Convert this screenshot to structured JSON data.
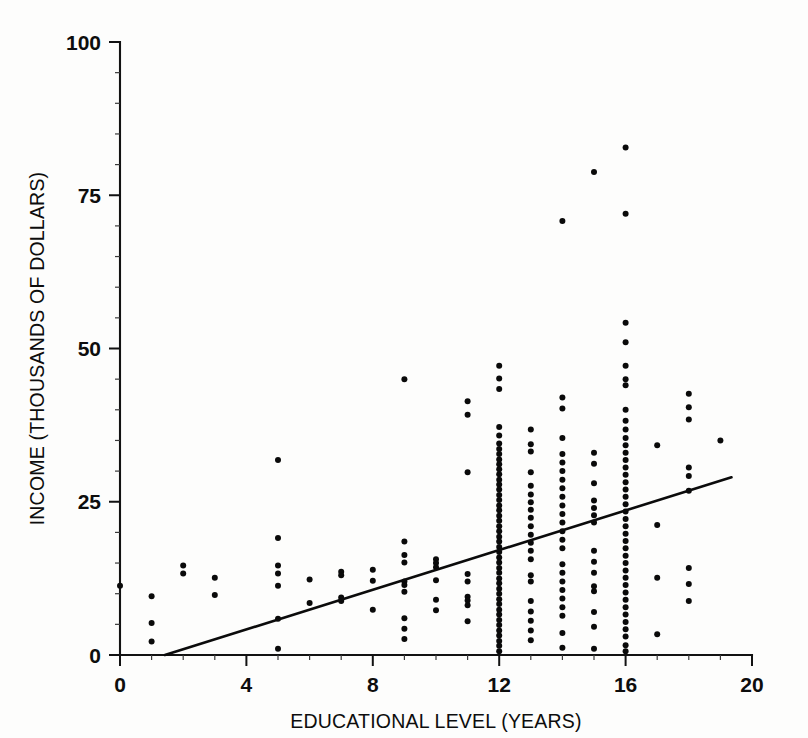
{
  "figure": {
    "background_color": "#fdfdfc",
    "ink_color": "#0a0a0a"
  },
  "axes": {
    "x_title": "EDUCATIONAL LEVEL (YEARS)",
    "y_title": "INCOME (THOUSANDS OF DOLLARS)",
    "x_ticks": [
      "0",
      "4",
      "8",
      "12",
      "16",
      "20"
    ],
    "y_ticks": [
      "0",
      "25",
      "50",
      "75",
      "100"
    ]
  },
  "chart_data": {
    "type": "scatter",
    "title": "",
    "subtitle": "",
    "xlabel": "EDUCATIONAL LEVEL (YEARS)",
    "ylabel": "INCOME (THOUSANDS OF DOLLARS)",
    "xlim": [
      0,
      20
    ],
    "ylim": [
      0,
      100
    ],
    "x_major_ticks": [
      0,
      4,
      8,
      12,
      16,
      20
    ],
    "y_major_ticks": [
      0,
      25,
      50,
      75,
      100
    ],
    "x_minor_tick_step": 1,
    "y_minor_tick_step": 5,
    "grid": false,
    "legend": null,
    "marker": {
      "shape": "circle",
      "size_px": 3.0,
      "color": "#0a0a0a"
    },
    "trendline": {
      "type": "linear-regression",
      "color": "#0b0b0b",
      "x_start": 1.42,
      "y_start": 0,
      "x_end": 19.35,
      "y_end": 29.0,
      "slope": 1.617,
      "intercept": -2.3
    },
    "columns": [
      {
        "x": 0,
        "values": [
          11.3
        ]
      },
      {
        "x": 1,
        "values": [
          9.6,
          5.2,
          2.2
        ]
      },
      {
        "x": 2,
        "values": [
          14.6,
          13.3
        ]
      },
      {
        "x": 3,
        "values": [
          12.6,
          9.8
        ]
      },
      {
        "x": 5,
        "values": [
          31.8,
          19.1,
          14.6,
          13.3,
          11.3,
          5.9,
          1.0
        ]
      },
      {
        "x": 6,
        "values": [
          12.3,
          8.5
        ]
      },
      {
        "x": 7,
        "values": [
          13.6,
          13.0,
          9.4,
          8.8
        ]
      },
      {
        "x": 8,
        "values": [
          13.9,
          12.1,
          7.4
        ]
      },
      {
        "x": 9,
        "values": [
          45.0,
          18.5,
          16.3,
          15.1,
          12.0,
          11.4,
          10.3,
          6.0,
          4.3,
          2.6
        ]
      },
      {
        "x": 10,
        "values": [
          15.6,
          15.0,
          14.3,
          12.2,
          9.0,
          7.3
        ]
      },
      {
        "x": 11,
        "values": [
          41.4,
          39.2,
          29.8,
          13.2,
          12.0,
          9.5,
          8.9,
          8.1,
          5.5
        ]
      },
      {
        "x": 12,
        "values": [
          47.2,
          45.1,
          43.4,
          37.2,
          35.8,
          34.5,
          33.6,
          32.8,
          31.9,
          31.1,
          30.3,
          29.5,
          28.6,
          27.8,
          27.0,
          26.1,
          25.3,
          24.4,
          23.6,
          22.7,
          21.9,
          21.0,
          20.2,
          19.3,
          18.5,
          17.6,
          16.8,
          15.9,
          15.1,
          14.2,
          13.4,
          12.5,
          11.7,
          10.8,
          10.0,
          9.1,
          8.3,
          7.4,
          6.6,
          5.7,
          4.9,
          4.0,
          3.2,
          2.3,
          1.5,
          0.6
        ]
      },
      {
        "x": 13,
        "values": [
          36.8,
          34.4,
          33.2,
          29.8,
          27.6,
          26.2,
          24.9,
          23.7,
          22.4,
          21.0,
          19.6,
          18.3,
          17.0,
          15.6,
          13.0,
          12.0,
          8.8,
          7.1,
          5.6,
          4.0,
          2.4
        ]
      },
      {
        "x": 14,
        "values": [
          70.8,
          42.0,
          40.2,
          35.4,
          32.8,
          31.4,
          30.0,
          28.6,
          27.2,
          25.8,
          24.4,
          23.0,
          21.6,
          20.2,
          18.8,
          17.4,
          14.8,
          13.4,
          12.0,
          10.6,
          9.2,
          7.8,
          6.4,
          3.6,
          1.2
        ]
      },
      {
        "x": 15,
        "values": [
          78.8,
          33.0,
          31.2,
          28.0,
          25.2,
          24.0,
          22.8,
          21.6,
          17.0,
          15.2,
          13.4,
          11.2,
          10.4,
          7.0,
          4.6,
          1.0
        ]
      },
      {
        "x": 16,
        "values": [
          82.8,
          72.0,
          54.2,
          51.0,
          47.2,
          45.0,
          44.0,
          40.0,
          38.2,
          36.8,
          35.4,
          34.2,
          33.0,
          31.8,
          30.6,
          29.4,
          28.2,
          27.0,
          25.8,
          24.6,
          23.4,
          22.2,
          21.0,
          19.8,
          18.6,
          17.4,
          16.2,
          15.0,
          13.8,
          12.6,
          11.4,
          10.2,
          9.0,
          7.8,
          6.6,
          5.4,
          4.2,
          3.0,
          1.6,
          0.6
        ]
      },
      {
        "x": 17,
        "values": [
          34.2,
          21.2,
          12.6,
          3.4
        ]
      },
      {
        "x": 18,
        "values": [
          42.6,
          40.4,
          38.4,
          30.6,
          29.2,
          26.8,
          14.2,
          11.6,
          8.8
        ]
      },
      {
        "x": 19,
        "values": [
          35.0
        ]
      }
    ]
  }
}
